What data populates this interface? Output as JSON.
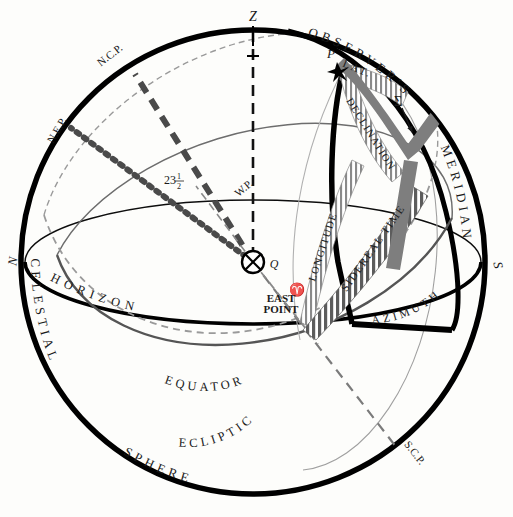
{
  "figure": {
    "colors": {
      "outline": "#000000",
      "background": "#fdfdfb",
      "equator": "#555555",
      "ecliptic": "#8d8d8d",
      "ncp_axis": "#4a4a4a",
      "nep_axis": "#4a4a4a",
      "band_light": "#8a8a8a",
      "band_dark": "#5e5e5e",
      "text": "#1a1a1a"
    }
  },
  "points": {
    "zenith": "Z",
    "pole": "P",
    "star": "Σ",
    "equator_point": "Q",
    "vernal_equinox": "♈",
    "north": "N",
    "south": "S",
    "east_point_line1": "EAST",
    "east_point_line2": "POINT",
    "ncp": "N.C.P.",
    "nep": "N.E.P.",
    "scp": "S.C.P.",
    "wp": "W.P.",
    "obliquity": "23",
    "obliquity_frac_num": "1",
    "obliquity_frac_den": "2"
  },
  "rim_labels": {
    "observers_meridian": "OBSERVER'S",
    "meridian": "MERIDIAN",
    "celestial": "CELESTIAL",
    "sphere": "SPHERE"
  },
  "circle_labels": {
    "horizon": "HORIZON",
    "equator": "EQUATOR",
    "ecliptic": "ECLIPTIC"
  },
  "measure_bands": [
    {
      "name": "latitude",
      "label": "LAT.",
      "style": "light-hatch"
    },
    {
      "name": "declination",
      "label": "DECLINATION",
      "style": "light-hatch"
    },
    {
      "name": "longitude",
      "label": "LONGITUDE",
      "style": "light-hatch"
    },
    {
      "name": "sidereal-time",
      "label": "SIDEREAL TIME",
      "style": "dark-hatch"
    },
    {
      "name": "azimuth",
      "label": "AZIMUTH",
      "style": "solid-thick"
    }
  ]
}
